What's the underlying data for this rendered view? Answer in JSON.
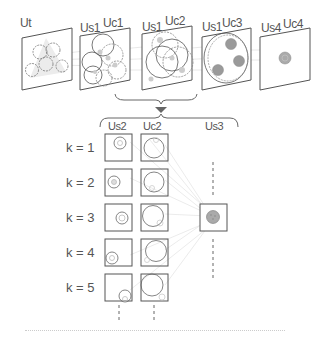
{
  "top_panels": [
    {
      "labels": [
        "Ut"
      ],
      "content": "stacked-dotted-circles"
    },
    {
      "labels": [
        "Us1",
        "Uc1"
      ],
      "content": "overlapping-circles"
    },
    {
      "labels": [
        "Us1",
        "Uc2"
      ],
      "content": "large-overlapping-circles"
    },
    {
      "labels": [
        "Us1",
        "Uc3"
      ],
      "content": "ellipse-with-three-filled-dots"
    },
    {
      "labels": [
        "Us4",
        "Uc4"
      ],
      "content": "single-filled-dot"
    }
  ],
  "bottom": {
    "column_headers": [
      "Us2",
      "Uc2",
      "Us3"
    ],
    "rows": [
      {
        "label": "k = 1"
      },
      {
        "label": "k = 2"
      },
      {
        "label": "k = 3"
      },
      {
        "label": "k = 4"
      },
      {
        "label": "k = 5"
      }
    ]
  },
  "colors": {
    "stroke": "#555555",
    "dotted": "#888888",
    "fill_gray": "#aaaaaa",
    "faint_lines": "#dddddd",
    "arrow": "#666666"
  }
}
